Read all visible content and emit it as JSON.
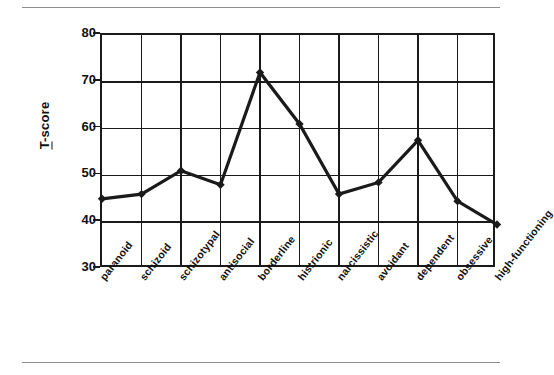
{
  "chart_data": {
    "type": "line",
    "title": "",
    "xlabel": "",
    "ylabel": "T-score",
    "ylim": [
      30,
      80
    ],
    "yticks": [
      80,
      70,
      60,
      50,
      40,
      30
    ],
    "grid": true,
    "legend": "none",
    "marker": "diamond",
    "line_color": "#1a1a1a",
    "categories": [
      "paranoid",
      "schizoid",
      "schizotypal",
      "antisocial",
      "borderline",
      "histrionic",
      "narcissistic",
      "avoidant",
      "dependent",
      "obsessive",
      "high-functioning"
    ],
    "values": [
      45,
      46,
      51,
      48,
      72,
      61,
      46,
      48.5,
      57.5,
      44.5,
      39.5
    ],
    "series": [
      {
        "name": "T-score",
        "values": [
          45,
          46,
          51,
          48,
          72,
          61,
          46,
          48.5,
          57.5,
          44.5,
          39.5
        ]
      }
    ]
  },
  "axis": {
    "y_title_first_char": "T",
    "y_title_rest": "-score"
  },
  "colors": {
    "line": "#1a1a1a",
    "frame": "#1a1a1a",
    "rule": "#8d8d8d",
    "background": "#ffffff"
  }
}
